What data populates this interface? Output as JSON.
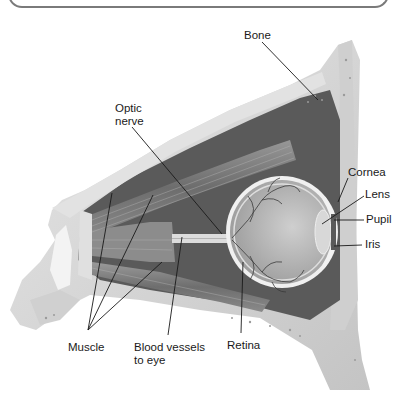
{
  "diagram": {
    "labels": [
      {
        "id": "bone",
        "text": "Bone",
        "x": 244,
        "y": 29
      },
      {
        "id": "optic-nerve",
        "text": "Optic\nnerve",
        "line1": "Optic",
        "line2": "nerve",
        "x": 115,
        "y": 106
      },
      {
        "id": "cornea",
        "text": "Cornea",
        "x": 349,
        "y": 169
      },
      {
        "id": "lens",
        "text": "Lens",
        "x": 365,
        "y": 190
      },
      {
        "id": "pupil",
        "text": "Pupil",
        "x": 365,
        "y": 214
      },
      {
        "id": "iris",
        "text": "Iris",
        "x": 364,
        "y": 239
      },
      {
        "id": "muscle",
        "text": "Muscle",
        "x": 68,
        "y": 342
      },
      {
        "id": "blood-vessels",
        "text": "Blood vessels to eye",
        "line1": "Blood vessels",
        "line2": "to eye",
        "x": 134,
        "y": 341
      },
      {
        "id": "retina",
        "text": "Retina",
        "x": 226,
        "y": 339
      }
    ],
    "colors": {
      "bone": "#d9d9d9",
      "bone_dark": "#bdbdbd",
      "cavity": "#4a4a4a",
      "muscle": "#8a8a8a",
      "eyeball": "#b8b8b8",
      "leader_line": "#1a1a1a",
      "frame": "#7a7a7a"
    }
  }
}
